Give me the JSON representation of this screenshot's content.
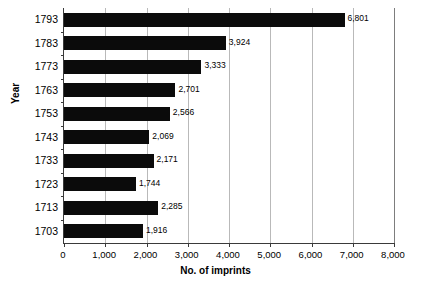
{
  "chart_data": {
    "type": "bar",
    "orientation": "horizontal",
    "title": "",
    "xlabel": "No. of imprints",
    "ylabel": "Year",
    "categories": [
      "1793",
      "1783",
      "1773",
      "1763",
      "1753",
      "1743",
      "1733",
      "1723",
      "1713",
      "1703"
    ],
    "values": [
      6801,
      3924,
      3333,
      2701,
      2566,
      2069,
      2171,
      1744,
      2285,
      1916
    ],
    "value_labels": [
      "6,801",
      "3,924",
      "3,333",
      "2,701",
      "2,566",
      "2,069",
      "2,171",
      "1,744",
      "2,285",
      "1,916"
    ],
    "xlim": [
      0,
      8000
    ],
    "xticks": [
      0,
      1000,
      2000,
      3000,
      4000,
      5000,
      6000,
      7000,
      8000
    ],
    "xtick_labels": [
      "0",
      "1,000",
      "2,000",
      "3,000",
      "4,000",
      "5,000",
      "6,000",
      "7,000",
      "8,000"
    ],
    "grid": "vertical",
    "legend": "none",
    "bar_color": "#0b0b0b",
    "grid_color": "#b9b9b9",
    "axis_color": "#3a3a3a",
    "background_color": "#ffffff"
  }
}
